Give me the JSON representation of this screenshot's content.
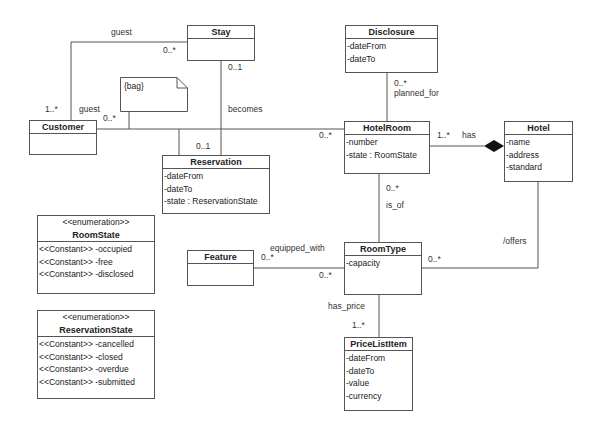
{
  "classes": {
    "stay": {
      "name": "Stay",
      "attrs": []
    },
    "customer": {
      "name": "Customer",
      "attrs": []
    },
    "reservation": {
      "name": "Reservation",
      "attrs": [
        "-dateFrom",
        "-dateTo",
        "-state : ReservationState"
      ]
    },
    "disclosure": {
      "name": "Disclosure",
      "attrs": [
        "-dateFrom",
        "-dateTo"
      ]
    },
    "hotelroom": {
      "name": "HotelRoom",
      "attrs": [
        "-number",
        "-state : RoomState"
      ]
    },
    "hotel": {
      "name": "Hotel",
      "attrs": [
        "-name",
        "-address",
        "-standard"
      ]
    },
    "roomtype": {
      "name": "RoomType",
      "attrs": [
        "-capacity"
      ]
    },
    "feature": {
      "name": "Feature",
      "attrs": []
    },
    "pricelistitem": {
      "name": "PriceListItem",
      "attrs": [
        "-dateFrom",
        "-dateTo",
        "-value",
        "-currency"
      ]
    },
    "roomstate": {
      "stereotype": "<<enumeration>>",
      "name": "RoomState",
      "attrs": [
        "<<Constant>> -occupied",
        "<<Constant>> -free",
        "<<Constant>> -disclosed"
      ]
    },
    "reservationstate": {
      "stereotype": "<<enumeration>>",
      "name": "ReservationState",
      "attrs": [
        "<<Constant>> -cancelled",
        "<<Constant>> -closed",
        "<<Constant>> -overdue",
        "<<Constant>> -submitted"
      ]
    }
  },
  "note": {
    "text": "{bag}"
  },
  "labels": {
    "guest_top": "guest",
    "stay_guest_mult": "0..*",
    "customer_top_mult": "1..*",
    "guest_side": "guest",
    "customer_hr_mult": "0..*",
    "stay_mult": "0..1",
    "becomes": "becomes",
    "reservation_mult": "0..1",
    "hr_left_mult": "0..*",
    "disclosure_mult": "0..*",
    "planned_for": "planned_for",
    "hr_has_mult": "1..*",
    "has": "has",
    "hr_isof_mult": "0..*",
    "is_of": "is_of",
    "equipped_with": "equipped_with",
    "feature_mult": "0..*",
    "rt_feature_mult": "0..*",
    "rt_offers_mult": "0..*",
    "offers": "/offers",
    "has_price": "has_price",
    "price_mult": "1..*"
  }
}
